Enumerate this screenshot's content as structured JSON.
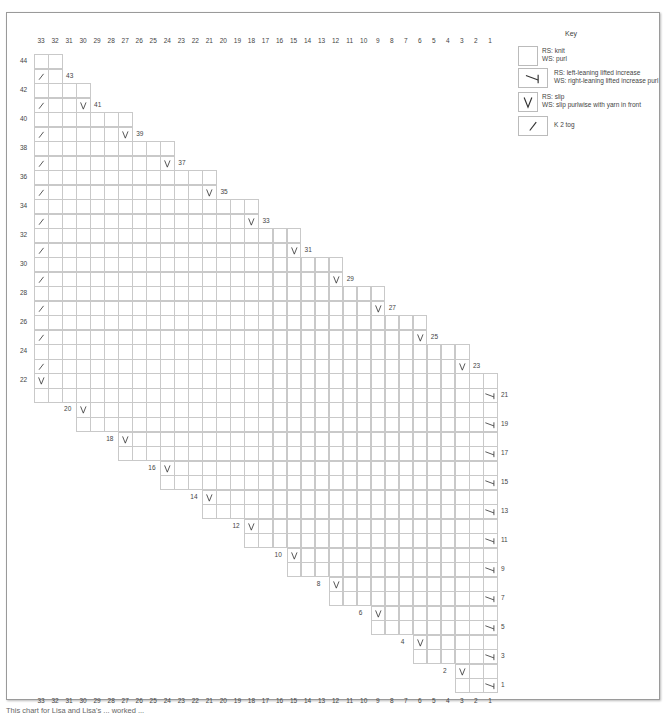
{
  "chart_title": "Key",
  "grid": {
    "columns": 33,
    "rows": 44,
    "column_labels": [
      "33",
      "32",
      "31",
      "30",
      "29",
      "28",
      "27",
      "26",
      "25",
      "24",
      "23",
      "22",
      "21",
      "20",
      "19",
      "18",
      "17",
      "16",
      "15",
      "14",
      "13",
      "12",
      "11",
      "10",
      "9",
      "8",
      "7",
      "6",
      "5",
      "4",
      "3",
      "2",
      "1"
    ],
    "cell_width": 14.03,
    "cell_height": 14.52,
    "origin_x": 34,
    "origin_y": 54
  },
  "key": {
    "title": "Key",
    "items": [
      {
        "symbol": "knit",
        "icon": "blank-square-icon",
        "line1": "RS: knit",
        "line2": "WS: purl"
      },
      {
        "symbol": "lifted-increase",
        "icon": "lifted-increase-icon",
        "line1": "RS: left-leaning lifted increase",
        "line2": "WS: right-leaning lifted increase purl"
      },
      {
        "symbol": "slip",
        "icon": "slip-v-icon",
        "line1": "RS: slip",
        "line2": "WS: slip purlwise with yarn in front"
      },
      {
        "symbol": "k2tog",
        "icon": "k2tog-slash-icon",
        "line1": "K 2 tog",
        "line2": ""
      }
    ]
  },
  "caption": "This chart for Lisa and Lisa's ... worked ...",
  "colors": {
    "grid_line": "#c9c9c9",
    "symbol": "#333333",
    "label": "#444444"
  },
  "chart_data": {
    "type": "table",
    "xlabel": "Stitch (column) 33 → 1",
    "ylabel": "Row 1 → 44",
    "rows": [
      {
        "row": 44,
        "from": 33,
        "to": 32,
        "symbols": {},
        "label_side": "left-margin"
      },
      {
        "row": 43,
        "from": 33,
        "to": 32,
        "symbols": {
          "33": "k2tog"
        },
        "label_side": "right"
      },
      {
        "row": 42,
        "from": 33,
        "to": 30,
        "symbols": {},
        "label_side": "left-margin"
      },
      {
        "row": 41,
        "from": 33,
        "to": 30,
        "symbols": {
          "33": "k2tog",
          "30": "slip"
        },
        "label_side": "right"
      },
      {
        "row": 40,
        "from": 33,
        "to": 27,
        "symbols": {},
        "label_side": "left-margin"
      },
      {
        "row": 39,
        "from": 33,
        "to": 27,
        "symbols": {
          "33": "k2tog",
          "27": "slip"
        },
        "label_side": "right"
      },
      {
        "row": 38,
        "from": 33,
        "to": 24,
        "symbols": {},
        "label_side": "left-margin"
      },
      {
        "row": 37,
        "from": 33,
        "to": 24,
        "symbols": {
          "33": "k2tog",
          "24": "slip"
        },
        "label_side": "right"
      },
      {
        "row": 36,
        "from": 33,
        "to": 21,
        "symbols": {},
        "label_side": "left-margin"
      },
      {
        "row": 35,
        "from": 33,
        "to": 21,
        "symbols": {
          "33": "k2tog",
          "21": "slip"
        },
        "label_side": "right"
      },
      {
        "row": 34,
        "from": 33,
        "to": 18,
        "symbols": {},
        "label_side": "left-margin"
      },
      {
        "row": 33,
        "from": 33,
        "to": 18,
        "symbols": {
          "33": "k2tog",
          "18": "slip"
        },
        "label_side": "right"
      },
      {
        "row": 32,
        "from": 33,
        "to": 15,
        "symbols": {},
        "label_side": "left-margin"
      },
      {
        "row": 31,
        "from": 33,
        "to": 15,
        "symbols": {
          "33": "k2tog",
          "15": "slip"
        },
        "label_side": "right"
      },
      {
        "row": 30,
        "from": 33,
        "to": 12,
        "symbols": {},
        "label_side": "left-margin"
      },
      {
        "row": 29,
        "from": 33,
        "to": 12,
        "symbols": {
          "33": "k2tog",
          "12": "slip"
        },
        "label_side": "right"
      },
      {
        "row": 28,
        "from": 33,
        "to": 9,
        "symbols": {},
        "label_side": "left-margin"
      },
      {
        "row": 27,
        "from": 33,
        "to": 9,
        "symbols": {
          "33": "k2tog",
          "9": "slip"
        },
        "label_side": "right"
      },
      {
        "row": 26,
        "from": 33,
        "to": 6,
        "symbols": {},
        "label_side": "left-margin"
      },
      {
        "row": 25,
        "from": 33,
        "to": 6,
        "symbols": {
          "33": "k2tog",
          "6": "slip"
        },
        "label_side": "right"
      },
      {
        "row": 24,
        "from": 33,
        "to": 3,
        "symbols": {},
        "label_side": "left-margin"
      },
      {
        "row": 23,
        "from": 33,
        "to": 3,
        "symbols": {
          "33": "k2tog",
          "3": "slip"
        },
        "label_side": "right"
      },
      {
        "row": 22,
        "from": 33,
        "to": 1,
        "symbols": {
          "33": "slip"
        },
        "label_side": "left-margin"
      },
      {
        "row": 21,
        "from": 33,
        "to": 1,
        "symbols": {
          "1": "lifted-increase"
        },
        "label_side": "right"
      },
      {
        "row": 20,
        "from": 30,
        "to": 1,
        "symbols": {
          "30": "slip"
        },
        "label_side": "left"
      },
      {
        "row": 19,
        "from": 30,
        "to": 1,
        "symbols": {
          "1": "lifted-increase"
        },
        "label_side": "right"
      },
      {
        "row": 18,
        "from": 27,
        "to": 1,
        "symbols": {
          "27": "slip"
        },
        "label_side": "left"
      },
      {
        "row": 17,
        "from": 27,
        "to": 1,
        "symbols": {
          "1": "lifted-increase"
        },
        "label_side": "right"
      },
      {
        "row": 16,
        "from": 24,
        "to": 1,
        "symbols": {
          "24": "slip"
        },
        "label_side": "left"
      },
      {
        "row": 15,
        "from": 24,
        "to": 1,
        "symbols": {
          "1": "lifted-increase"
        },
        "label_side": "right"
      },
      {
        "row": 14,
        "from": 21,
        "to": 1,
        "symbols": {
          "21": "slip"
        },
        "label_side": "left"
      },
      {
        "row": 13,
        "from": 21,
        "to": 1,
        "symbols": {
          "1": "lifted-increase"
        },
        "label_side": "right"
      },
      {
        "row": 12,
        "from": 18,
        "to": 1,
        "symbols": {
          "18": "slip"
        },
        "label_side": "left"
      },
      {
        "row": 11,
        "from": 18,
        "to": 1,
        "symbols": {
          "1": "lifted-increase"
        },
        "label_side": "right"
      },
      {
        "row": 10,
        "from": 15,
        "to": 1,
        "symbols": {
          "15": "slip"
        },
        "label_side": "left"
      },
      {
        "row": 9,
        "from": 15,
        "to": 1,
        "symbols": {
          "1": "lifted-increase"
        },
        "label_side": "right"
      },
      {
        "row": 8,
        "from": 12,
        "to": 1,
        "symbols": {
          "12": "slip"
        },
        "label_side": "left"
      },
      {
        "row": 7,
        "from": 12,
        "to": 1,
        "symbols": {
          "1": "lifted-increase"
        },
        "label_side": "right"
      },
      {
        "row": 6,
        "from": 9,
        "to": 1,
        "symbols": {
          "9": "slip"
        },
        "label_side": "left"
      },
      {
        "row": 5,
        "from": 9,
        "to": 1,
        "symbols": {
          "1": "lifted-increase"
        },
        "label_side": "right"
      },
      {
        "row": 4,
        "from": 6,
        "to": 1,
        "symbols": {
          "6": "slip"
        },
        "label_side": "left"
      },
      {
        "row": 3,
        "from": 6,
        "to": 1,
        "symbols": {
          "1": "lifted-increase"
        },
        "label_side": "right"
      },
      {
        "row": 2,
        "from": 3,
        "to": 1,
        "symbols": {
          "3": "slip"
        },
        "label_side": "left"
      },
      {
        "row": 1,
        "from": 3,
        "to": 1,
        "symbols": {
          "1": "lifted-increase"
        },
        "label_side": "right"
      }
    ]
  }
}
